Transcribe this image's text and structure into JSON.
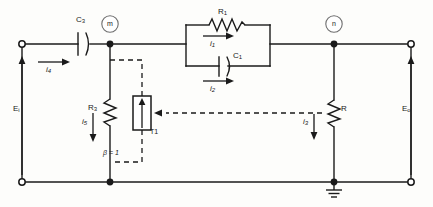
{
  "diagram": {
    "background": "#fdfdfb",
    "line_color": "#1a1a1a",
    "dashed_color": "#1a1a1a"
  },
  "nodes": {
    "m": "m",
    "n": "n"
  },
  "components": {
    "c3": {
      "label": "C",
      "sub": "3"
    },
    "r1": {
      "label": "R",
      "sub": "1"
    },
    "c1": {
      "label": "C",
      "sub": "1"
    },
    "r3": {
      "label": "R",
      "sub": "3"
    },
    "r_load": {
      "label": "R",
      "sub": ""
    },
    "t1": {
      "label": "T1"
    }
  },
  "currents": {
    "i1": {
      "label": "i",
      "sub": "1"
    },
    "i2": {
      "label": "i",
      "sub": "2"
    },
    "i3": {
      "label": "i",
      "sub": "3"
    },
    "i4": {
      "label": "i",
      "sub": "4"
    },
    "i5": {
      "label": "i",
      "sub": "5"
    }
  },
  "voltages": {
    "input": {
      "label": "E",
      "sub": "i"
    },
    "output": {
      "label": "E",
      "sub": "o"
    }
  },
  "annotations": {
    "beta": "β = 1"
  }
}
